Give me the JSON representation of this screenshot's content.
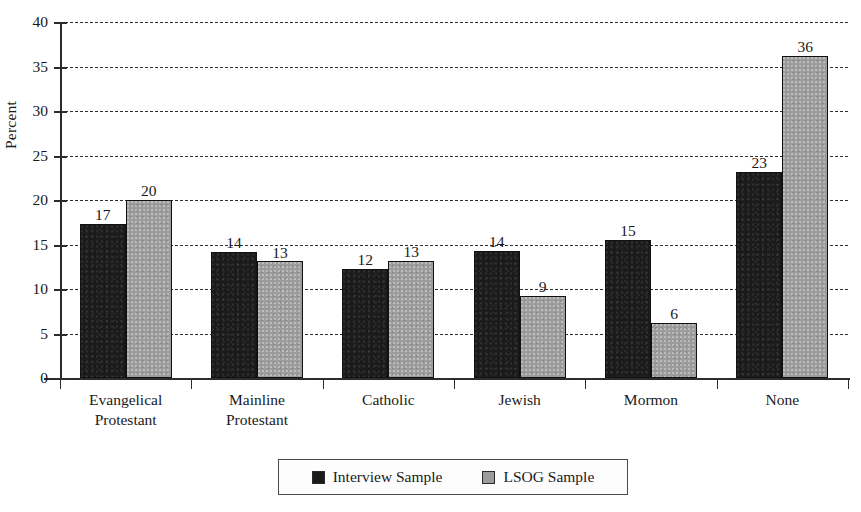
{
  "chart_data": {
    "type": "bar",
    "title": "",
    "subtitle": "",
    "xlabel": "",
    "ylabel": "Percent",
    "ylim": [
      0,
      40
    ],
    "ytick_step": 5,
    "yticks": [
      "40",
      "35",
      "30",
      "25",
      "20",
      "15",
      "10",
      "5",
      "0"
    ],
    "grid": true,
    "grid_style": "dashed-horizontal",
    "legend_position": "bottom-center",
    "categories": [
      "Evangelical Protestant",
      "Mainline Protestant",
      "Catholic",
      "Jewish",
      "Mormon",
      "None"
    ],
    "category_lines": [
      [
        "Evangelical",
        "Protestant"
      ],
      [
        "Mainline",
        "Protestant"
      ],
      [
        "Catholic"
      ],
      [
        "Jewish"
      ],
      [
        "Mormon"
      ],
      [
        "None"
      ]
    ],
    "series": [
      {
        "name": "Interview Sample",
        "color": "#1b1b1b",
        "values": [
          17,
          14,
          12,
          14,
          15,
          23
        ],
        "plotted_values": [
          17.3,
          14.2,
          12.3,
          14.3,
          15.5,
          23.2
        ],
        "labels": [
          "17",
          "14",
          "12",
          "14",
          "15",
          "23"
        ]
      },
      {
        "name": "LSOG Sample",
        "color": "#9c9c9c",
        "values": [
          20,
          13,
          13,
          9,
          6,
          36
        ],
        "plotted_values": [
          20.0,
          13.1,
          13.2,
          9.2,
          6.2,
          36.2
        ],
        "labels": [
          "20",
          "13",
          "13",
          "9",
          "6",
          "36"
        ]
      }
    ]
  },
  "legend": {
    "items": [
      {
        "label": "Interview Sample"
      },
      {
        "label": "LSOG Sample"
      }
    ]
  }
}
